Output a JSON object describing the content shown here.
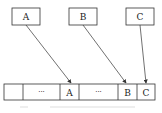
{
  "diagram": {
    "top_boxes": [
      {
        "label": "A"
      },
      {
        "label": "B"
      },
      {
        "label": "C"
      }
    ],
    "array_cells": [
      {
        "label": ""
      },
      {
        "label": "···"
      },
      {
        "label": "A"
      },
      {
        "label": "···"
      },
      {
        "label": "B"
      },
      {
        "label": "C"
      }
    ],
    "caption": "",
    "colors": {
      "stroke": "#333333",
      "background": "#ffffff"
    }
  }
}
